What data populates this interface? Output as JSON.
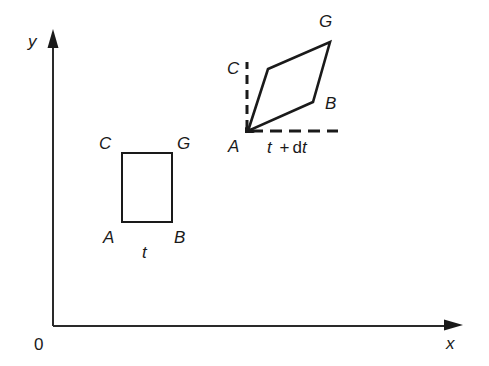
{
  "diagram": {
    "type": "fluid-element-deformation",
    "axes": {
      "origin_label": "0",
      "x_label": "x",
      "y_label": "y"
    },
    "element_before": {
      "time_label": "t",
      "vertices": {
        "A": "A",
        "B": "B",
        "C": "C",
        "G": "G"
      }
    },
    "element_after": {
      "time_label_t": "t",
      "time_label_plus": "+",
      "time_label_d": "d",
      "time_label_t2": "t",
      "vertices": {
        "A": "A",
        "B": "B",
        "C": "C",
        "G": "G"
      }
    },
    "colors": {
      "line": "#1a1a1a",
      "background": "#ffffff"
    }
  }
}
